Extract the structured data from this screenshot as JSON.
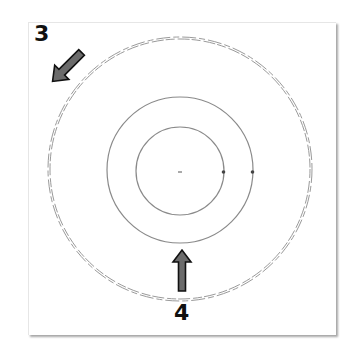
{
  "figure": {
    "labels": [
      {
        "id": "3",
        "text": "3"
      },
      {
        "id": "4",
        "text": "4"
      }
    ],
    "icons": {
      "arrow_3": "diagonal-arrow-down-right",
      "arrow_4": "arrow-up"
    },
    "colors": {
      "background": "#ffffff",
      "circle_stroke": "#8a8a8a",
      "arrow_fill": "#6b6b6b",
      "arrow_outline": "#111111",
      "label": "#111111"
    },
    "circles": [
      {
        "name": "inner",
        "cx": 180,
        "cy": 170,
        "r": 44,
        "style": "solid"
      },
      {
        "name": "middle",
        "cx": 180,
        "cy": 170,
        "r": 73,
        "style": "solid"
      },
      {
        "name": "outer",
        "cx": 180,
        "cy": 169,
        "r": 131,
        "style": "double-dashed"
      }
    ],
    "markers": [
      {
        "name": "center-point",
        "x": 180,
        "y": 172
      },
      {
        "name": "inner-circle-node",
        "x": 223,
        "y": 172
      },
      {
        "name": "middle-circle-node",
        "x": 252,
        "y": 172
      }
    ]
  }
}
